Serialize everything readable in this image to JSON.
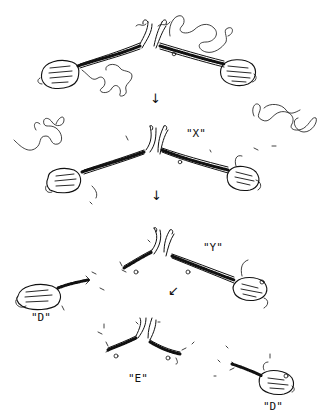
{
  "diagram": {
    "type": "hand-drawn biological schematic",
    "stroke_color": "#111111",
    "background": "#ffffff",
    "stages": [
      {
        "id": "stage-1",
        "description": "intact paired structure with two oval bodies joined by beaded stalks at a central hinge, with loose coiled strands"
      },
      {
        "id": "stage-2",
        "description": "paired structure with released coiled strands",
        "label": "\"X\""
      },
      {
        "id": "stage-3",
        "description": "structure partially separating; one oval body detached",
        "labels": [
          "\"Y\"",
          "\"D\""
        ]
      },
      {
        "id": "stage-4",
        "description": "central hinge fragment and detached oval body",
        "labels": [
          "\"E\"",
          "\"D\""
        ]
      }
    ],
    "labels": {
      "x": "\"X\"",
      "y": "\"Y\"",
      "d_left": "\"D\"",
      "e": "\"E\"",
      "d_right": "\"D\""
    },
    "arrows": {
      "a1": "↓",
      "a2": "↓",
      "a3": "↙"
    }
  }
}
